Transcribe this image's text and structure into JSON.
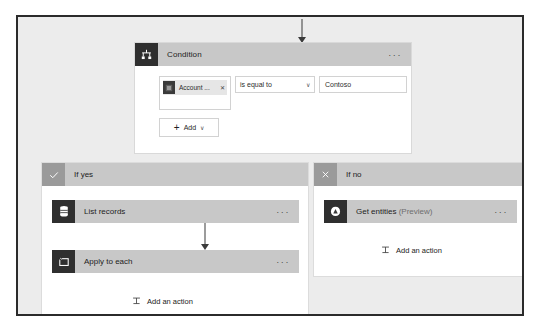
{
  "canvas": {
    "background_color": "#ececec",
    "border_color": "#2b2b2b"
  },
  "condition": {
    "title": "Condition",
    "icon": "condition-branch-icon",
    "menu": "···",
    "row": {
      "token": {
        "label": "Account ...",
        "icon": "dynamic-content-icon",
        "remove": "✕"
      },
      "operator": {
        "value": "is equal to",
        "chevron": "∨"
      },
      "value": "Contoso"
    },
    "add_button": {
      "plus": "+",
      "label": "Add",
      "chevron": "∨"
    }
  },
  "branches": [
    {
      "id": "yes",
      "title": "If yes",
      "icon": "checkmark-icon",
      "actions": [
        {
          "title": "List records",
          "suffix": "",
          "icon": "database-icon",
          "menu": "···"
        },
        {
          "title": "Apply to each",
          "suffix": "",
          "icon": "loop-icon",
          "menu": "···"
        }
      ],
      "add_action": {
        "label": "Add an action",
        "icon": "add-action-icon"
      }
    },
    {
      "id": "no",
      "title": "If no",
      "icon": "close-x-icon",
      "actions": [
        {
          "title": "Get entities ",
          "suffix": "(Preview)",
          "icon": "text-analytics-icon",
          "menu": "···"
        }
      ],
      "add_action": {
        "label": "Add an action",
        "icon": "add-action-icon"
      }
    }
  ]
}
